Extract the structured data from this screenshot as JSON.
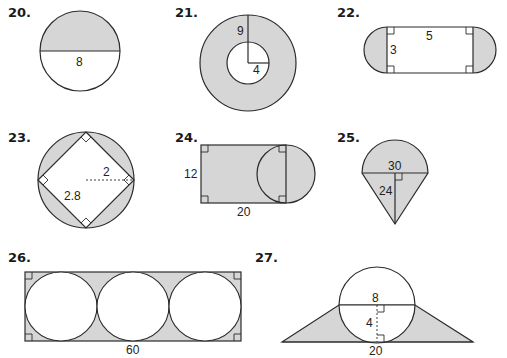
{
  "colors": {
    "shade": "#d6d6d6",
    "stroke": "#2b2b2b",
    "background": "#ffffff"
  },
  "problems": [
    {
      "number": "20.",
      "shape": "circle with shaded upper semicircle",
      "labels": {
        "diameter": "8"
      }
    },
    {
      "number": "21.",
      "shape": "annulus (shaded ring)",
      "labels": {
        "outer_radius": "9",
        "inner_radius": "4"
      }
    },
    {
      "number": "22.",
      "shape": "rectangle with shaded semicircles at ends",
      "labels": {
        "length": "5",
        "width": "3"
      }
    },
    {
      "number": "23.",
      "shape": "square inscribed in circle, shaded segments",
      "labels": {
        "radius": "2",
        "side": "2.8"
      }
    },
    {
      "number": "24.",
      "shape": "rectangle with circle on right side",
      "labels": {
        "height": "12",
        "width": "20"
      }
    },
    {
      "number": "25.",
      "shape": "semicircle on triangle (cone)",
      "labels": {
        "diameter": "30",
        "height": "24"
      }
    },
    {
      "number": "26.",
      "shape": "three circles inscribed in rectangle",
      "labels": {
        "length": "60"
      }
    },
    {
      "number": "27.",
      "shape": "circle over trapezoid",
      "labels": {
        "chord": "8",
        "height": "4",
        "base": "20"
      }
    }
  ]
}
